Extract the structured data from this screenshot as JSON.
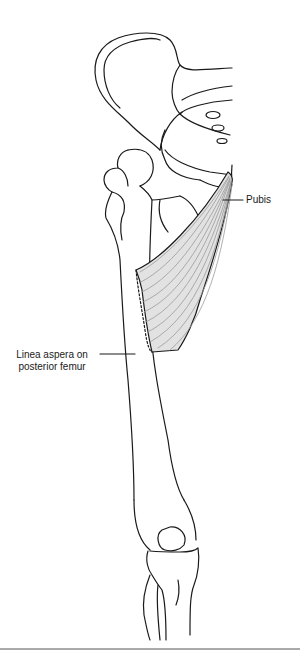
{
  "diagram": {
    "labels": {
      "pubis": "Pubis",
      "linea_aspera_line1": "Linea aspera on",
      "linea_aspera_line2": "posterior femur"
    },
    "colors": {
      "stroke": "#1a1a1a",
      "muscle_fill": "#e2e2e2",
      "muscle_fibers": "#9a9a9a"
    }
  }
}
